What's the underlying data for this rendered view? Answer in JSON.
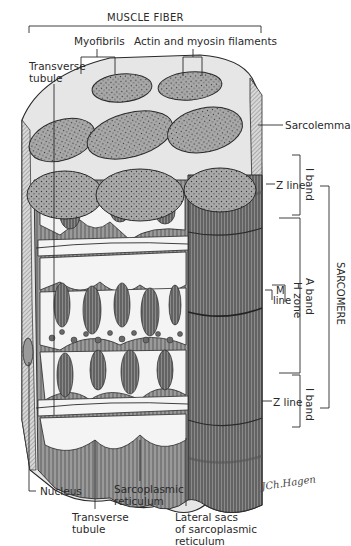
{
  "title": "MUSCLE FIBER",
  "labels": {
    "myofibrils": "Myofibrils",
    "actin_myosin": "Actin and myosin filaments",
    "transverse_tubule_top": [
      "Transverse",
      "tubule"
    ],
    "sarcolemma": "Sarcolemma",
    "z_line_top": "Z line",
    "z_line_bottom": "Z line",
    "m_line": [
      "M",
      "line"
    ],
    "h_zone": "H zone",
    "a_band": "A band",
    "i_band_top": "I band",
    "i_band_bottom": "I band",
    "sarcomere": "SARCOMERE",
    "nucleus": "Nucleus",
    "sarcoplasmic_reticulum": [
      "Sarcoplasmic",
      "reticulum"
    ],
    "transverse_tubule_bottom": [
      "Transverse",
      "tubule"
    ],
    "lateral_sacs": [
      "Lateral sacs",
      "of sarcoplasmic",
      "reticulum"
    ]
  },
  "colors": {
    "ink": "#2a2a2a",
    "fibril_top": "#a8a8a8",
    "fibril_side": "#8c8c8c",
    "reticulum": "#f2f2f2",
    "background": "#ffffff"
  }
}
